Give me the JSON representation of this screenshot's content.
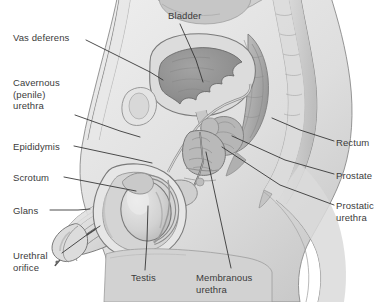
{
  "figure": {
    "width": 385,
    "height": 302,
    "background_color": "#ffffff",
    "label_color": "#3b3b3b",
    "leader_line_color": "#2e2e2e"
  },
  "palette": {
    "skin_light": "#efefef",
    "skin_mid": "#e2e2e2",
    "tissue_light": "#e9e9e9",
    "tissue_mid": "#d6d6d6",
    "tissue_dark": "#bdbdbd",
    "organ_dark": "#9a9a9a",
    "cavity_dark": "#8d8d8d",
    "outline": "#6f6f6f",
    "outline_soft": "#9d9d9d"
  },
  "labels": [
    {
      "id": "vas-deferens",
      "text": "Vas deferens",
      "side": "left",
      "x": 13,
      "y": 32,
      "leader": [
        [
          86,
          40
        ],
        [
          150,
          72
        ],
        [
          163,
          80
        ]
      ]
    },
    {
      "id": "cavernous-penile-urethra",
      "text": "Cavernous\n(penile)\nurethra",
      "side": "left",
      "x": 13,
      "y": 77,
      "leader": [
        [
          75,
          115
        ],
        [
          120,
          131
        ],
        [
          140,
          137
        ]
      ]
    },
    {
      "id": "epididymis",
      "text": "Epididymis",
      "side": "left",
      "x": 13,
      "y": 141,
      "leader": [
        [
          74,
          146
        ],
        [
          130,
          158
        ],
        [
          152,
          163
        ]
      ]
    },
    {
      "id": "scrotum",
      "text": "Scrotum",
      "side": "left",
      "x": 13,
      "y": 172,
      "leader": [
        [
          64,
          177
        ],
        [
          110,
          186
        ],
        [
          136,
          191
        ]
      ]
    },
    {
      "id": "glans",
      "text": "Glans",
      "side": "left",
      "x": 13,
      "y": 205,
      "leader": [
        [
          50,
          210
        ],
        [
          78,
          210
        ],
        [
          90,
          209
        ]
      ]
    },
    {
      "id": "urethral-orifice",
      "text": "Urethral\norifice",
      "side": "left",
      "x": 13,
      "y": 250,
      "leader": [
        [
          62,
          253
        ],
        [
          88,
          234
        ],
        [
          100,
          226
        ]
      ]
    },
    {
      "id": "bladder",
      "text": "Bladder",
      "side": "top",
      "x": 168,
      "y": 10,
      "leader": [
        [
          180,
          24
        ],
        [
          196,
          60
        ],
        [
          203,
          82
        ]
      ]
    },
    {
      "id": "rectum",
      "text": "Rectum",
      "side": "right",
      "x": 336,
      "y": 137,
      "leader": [
        [
          334,
          141
        ],
        [
          300,
          130
        ],
        [
          272,
          118
        ]
      ]
    },
    {
      "id": "prostate",
      "text": "Prostate",
      "side": "right",
      "x": 336,
      "y": 170,
      "leader": [
        [
          334,
          174
        ],
        [
          285,
          160
        ],
        [
          232,
          136
        ]
      ]
    },
    {
      "id": "prostatic-urethra",
      "text": "Prostatic\nurethra",
      "side": "right",
      "x": 336,
      "y": 200,
      "leader": [
        [
          334,
          205
        ],
        [
          280,
          185
        ],
        [
          222,
          147
        ]
      ]
    },
    {
      "id": "testis",
      "text": "Testis",
      "side": "bottom",
      "x": 131,
      "y": 272,
      "leader": [
        [
          145,
          270
        ],
        [
          147,
          240
        ],
        [
          148,
          206
        ]
      ]
    },
    {
      "id": "membranous-urethra",
      "text": "Membranous\nurethra",
      "side": "bottom",
      "x": 196,
      "y": 272,
      "leader": [
        [
          231,
          268
        ],
        [
          218,
          208
        ],
        [
          206,
          152
        ]
      ]
    }
  ]
}
